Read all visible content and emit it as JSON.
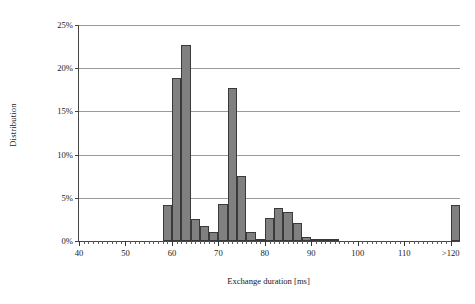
{
  "chart_data": {
    "type": "bar",
    "title": "",
    "xlabel": "Exchange duration [ms]",
    "ylabel": "Distribution",
    "xlim": [
      40,
      122
    ],
    "ylim": [
      0,
      25
    ],
    "grid": true,
    "legend": null,
    "yticks": [
      "0%",
      "5%",
      "10%",
      "15%",
      "20%",
      "25%"
    ],
    "ytick_values": [
      0,
      5,
      10,
      15,
      20,
      25
    ],
    "xticks": [
      "40",
      "50",
      "60",
      "70",
      "80",
      "90",
      "100",
      "110",
      ">120"
    ],
    "xtick_values": [
      40,
      50,
      60,
      70,
      80,
      90,
      100,
      110,
      120
    ],
    "bar_color": "#808080",
    "bar_edge_color": "#3a3a3a",
    "bin_width": 2,
    "categories": [
      58,
      60,
      62,
      64,
      66,
      68,
      70,
      72,
      74,
      76,
      78,
      80,
      82,
      84,
      86,
      88,
      90,
      92,
      94,
      120
    ],
    "values": [
      4.2,
      18.9,
      22.7,
      2.5,
      1.7,
      1.0,
      4.3,
      17.7,
      7.5,
      1.1,
      0.2,
      2.7,
      3.8,
      3.4,
      2.1,
      0.5,
      0.15,
      0.15,
      0.15,
      4.2
    ]
  }
}
